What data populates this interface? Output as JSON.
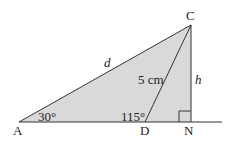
{
  "diagram": {
    "fill_color": "#d9d9d9",
    "stroke_color": "#333333",
    "points": {
      "A": {
        "label": "A"
      },
      "C": {
        "label": "C"
      },
      "D": {
        "label": "D"
      },
      "N": {
        "label": "N"
      }
    },
    "labels": {
      "side_AC": "d",
      "side_DC": "5 cm",
      "side_CN": "h",
      "angle_A": "30°",
      "angle_D": "115°"
    },
    "right_angle_at": "N"
  }
}
